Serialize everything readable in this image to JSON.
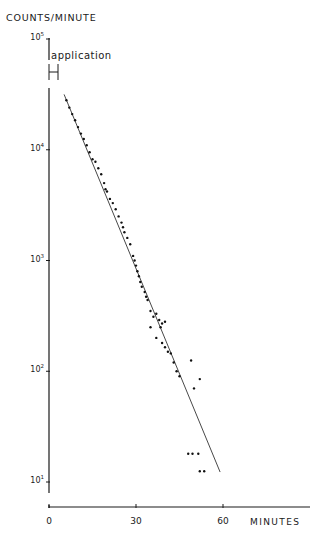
{
  "chart_data": {
    "type": "scatter",
    "title": "",
    "ylabel": "COUNTS/MINUTE",
    "xlabel": "MINUTES",
    "yscale": "log",
    "ylim": [
      10,
      100000
    ],
    "xlim": [
      0,
      90
    ],
    "grid": false,
    "legend": null,
    "y_ticks": [
      {
        "base": "10",
        "exp": "5",
        "value": 100000
      },
      {
        "base": "10",
        "exp": "4",
        "value": 10000
      },
      {
        "base": "10",
        "exp": "3",
        "value": 1000
      },
      {
        "base": "10",
        "exp": "2",
        "value": 100
      },
      {
        "base": "10",
        "exp": "1",
        "value": 10
      }
    ],
    "x_ticks": [
      {
        "label": "0",
        "value": 0
      },
      {
        "label": "30",
        "value": 30
      },
      {
        "label": "60",
        "value": 60
      }
    ],
    "annotations": [
      {
        "text": "application",
        "type": "bracket",
        "x_range": [
          0,
          3
        ]
      }
    ],
    "fit_line": {
      "x": [
        5.2,
        59.0
      ],
      "y": [
        31600,
        12.3
      ]
    },
    "series": [
      {
        "name": "measured counts",
        "points": [
          [
            6,
            28000
          ],
          [
            7,
            24000
          ],
          [
            8,
            21000
          ],
          [
            9,
            18500
          ],
          [
            10,
            16000
          ],
          [
            11,
            14000
          ],
          [
            12,
            12500
          ],
          [
            13,
            11000
          ],
          [
            14,
            9500
          ],
          [
            15,
            8200
          ],
          [
            16,
            7800
          ],
          [
            17,
            6800
          ],
          [
            18,
            6000
          ],
          [
            19,
            5000
          ],
          [
            19.5,
            4400
          ],
          [
            20,
            4200
          ],
          [
            21,
            3600
          ],
          [
            22,
            3300
          ],
          [
            23,
            2900
          ],
          [
            24,
            2500
          ],
          [
            25,
            2200
          ],
          [
            25.5,
            2000
          ],
          [
            26,
            1800
          ],
          [
            27,
            1600
          ],
          [
            28,
            1400
          ],
          [
            29,
            1100
          ],
          [
            29.5,
            1000
          ],
          [
            30,
            900
          ],
          [
            30.5,
            800
          ],
          [
            31,
            720
          ],
          [
            31.5,
            640
          ],
          [
            32,
            580
          ],
          [
            33,
            520
          ],
          [
            33.5,
            470
          ],
          [
            34,
            440
          ],
          [
            35,
            350
          ],
          [
            36,
            310
          ],
          [
            35,
            250
          ],
          [
            37,
            330
          ],
          [
            38,
            290
          ],
          [
            38.5,
            250
          ],
          [
            39,
            270
          ],
          [
            40,
            280
          ],
          [
            37,
            200
          ],
          [
            39,
            180
          ],
          [
            40,
            165
          ],
          [
            41,
            150
          ],
          [
            42,
            145
          ],
          [
            43,
            120
          ],
          [
            44,
            100
          ],
          [
            45,
            90
          ],
          [
            49,
            125
          ],
          [
            52,
            85
          ],
          [
            50,
            70
          ],
          [
            48,
            18
          ],
          [
            49.5,
            18
          ],
          [
            51.5,
            18
          ],
          [
            52,
            12.5
          ],
          [
            53.5,
            12.5
          ]
        ]
      }
    ]
  }
}
